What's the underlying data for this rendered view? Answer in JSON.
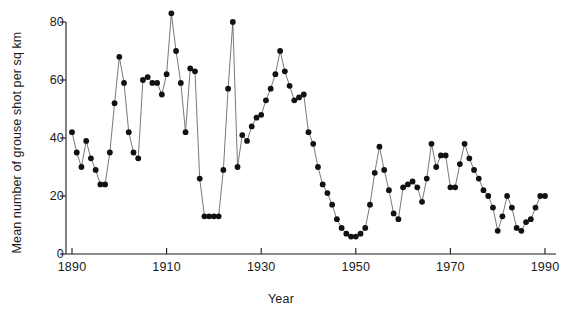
{
  "chart_data": {
    "type": "line",
    "title": "",
    "xlabel": "Year",
    "ylabel": "Mean number of grouse shot per sq km",
    "xlim": [
      1889,
      1991
    ],
    "ylim": [
      0,
      84
    ],
    "grid": false,
    "legend": null,
    "marker": "filled-circle",
    "xticks": [
      1890,
      1910,
      1930,
      1950,
      1970,
      1990
    ],
    "xtick_labels": [
      "1890",
      "1910",
      "1930",
      "1950",
      "1970",
      "1990"
    ],
    "yticks": [
      0,
      20,
      40,
      60,
      80
    ],
    "ytick_labels": [
      "0",
      "20",
      "40",
      "60",
      "80"
    ],
    "series": [
      {
        "name": "Mean grouse shot per sq km",
        "x": [
          1890,
          1891,
          1892,
          1893,
          1894,
          1895,
          1896,
          1897,
          1898,
          1899,
          1900,
          1901,
          1902,
          1903,
          1904,
          1905,
          1906,
          1907,
          1908,
          1909,
          1910,
          1911,
          1912,
          1913,
          1914,
          1915,
          1916,
          1917,
          1918,
          1919,
          1920,
          1921,
          1922,
          1923,
          1924,
          1925,
          1926,
          1927,
          1928,
          1929,
          1930,
          1931,
          1932,
          1933,
          1934,
          1935,
          1936,
          1937,
          1938,
          1939,
          1940,
          1941,
          1942,
          1943,
          1944,
          1945,
          1946,
          1947,
          1948,
          1949,
          1950,
          1951,
          1952,
          1953,
          1954,
          1955,
          1956,
          1957,
          1958,
          1959,
          1960,
          1961,
          1962,
          1963,
          1964,
          1965,
          1966,
          1967,
          1968,
          1969,
          1970,
          1971,
          1972,
          1973,
          1974,
          1975,
          1976,
          1977,
          1978,
          1979,
          1980,
          1981,
          1982,
          1983,
          1984,
          1985,
          1986,
          1987,
          1988,
          1989,
          1990
        ],
        "values": [
          42,
          35,
          30,
          39,
          33,
          29,
          24,
          24,
          35,
          52,
          68,
          59,
          42,
          35,
          33,
          60,
          61,
          59,
          59,
          55,
          62,
          83,
          70,
          59,
          42,
          64,
          63,
          26,
          13,
          13,
          13,
          13,
          29,
          57,
          80,
          30,
          41,
          39,
          44,
          47,
          48,
          53,
          57,
          62,
          70,
          63,
          58,
          53,
          54,
          55,
          42,
          38,
          30,
          24,
          21,
          17,
          12,
          9,
          7,
          6,
          6,
          7,
          9,
          17,
          28,
          37,
          29,
          22,
          14,
          12,
          23,
          24,
          25,
          23,
          18,
          26,
          38,
          30,
          34,
          34,
          23,
          23,
          31,
          38,
          33,
          29,
          26,
          22,
          20,
          16,
          8,
          13,
          20,
          16,
          9,
          8,
          11,
          12,
          16,
          20,
          20
        ]
      }
    ]
  }
}
